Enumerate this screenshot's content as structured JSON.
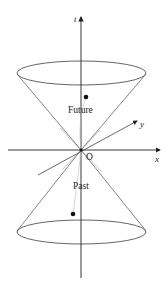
{
  "diagram": {
    "axes": {
      "t": {
        "label": "t"
      },
      "x": {
        "label": "x"
      },
      "y": {
        "label": "y"
      },
      "origin": {
        "label": "O"
      }
    },
    "regions": {
      "future": {
        "label": "Future"
      },
      "past": {
        "label": "Past"
      }
    },
    "colors": {
      "axis": "#222222",
      "cone": "#555555",
      "guide": "#bbbbbb",
      "dot": "#111111"
    }
  }
}
